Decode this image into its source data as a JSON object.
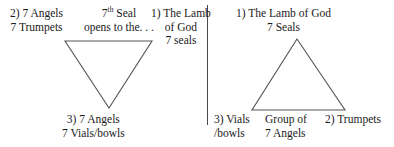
{
  "canvas": {
    "width": 394,
    "height": 147,
    "background": "#ffffff",
    "text_color": "#1a1a1a"
  },
  "divider": {
    "color": "#4a4a4a",
    "orientation": "vertical"
  },
  "left_panel": {
    "triangle": {
      "direction": "down",
      "stroke": "#555555"
    },
    "labels": {
      "trumpets": {
        "line1": "2) 7 Angels",
        "line2": "7 Trumpets"
      },
      "seventh_seal": {
        "line1_prefix": "7",
        "line1_sup": "th",
        "line1_suffix": " Seal",
        "line2": "opens to the. . ."
      },
      "lamb": {
        "line1": "1) The Lamb",
        "line2": "of God",
        "line3": "7 seals"
      },
      "vials": {
        "line1": "3) 7 Angels",
        "line2": "7 Vials/bowls"
      }
    }
  },
  "right_panel": {
    "triangle": {
      "direction": "up",
      "stroke": "#555555"
    },
    "labels": {
      "lamb": {
        "line1": "1) The Lamb of God",
        "line2": "7 Seals"
      },
      "vials": {
        "line1": "3) Vials",
        "line2": "/bowls"
      },
      "group": {
        "line1": "Group of",
        "line2": "7 Angels"
      },
      "trumpets": {
        "line1": "2) Trumpets"
      }
    }
  }
}
